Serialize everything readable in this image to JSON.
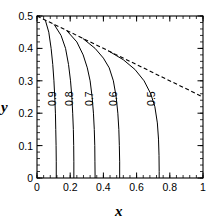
{
  "chart_data": {
    "type": "line",
    "title": "",
    "xlabel": "x",
    "ylabel": "y",
    "xlim": [
      0,
      1
    ],
    "ylim": [
      0,
      0.5
    ],
    "grid": false,
    "legend": null,
    "xticks": [
      "0",
      "0.2",
      "0.4",
      "0.6",
      "0.8",
      "1"
    ],
    "xtick_values": [
      0,
      0.2,
      0.4,
      0.6,
      0.8,
      1
    ],
    "yticks": [
      "0",
      "0.1",
      "0.2",
      "0.3",
      "0.4",
      "0.5"
    ],
    "ytick_values": [
      0,
      0.1,
      0.2,
      0.3,
      0.4,
      0.5
    ],
    "minor_ticks_per_interval": 4,
    "tick_direction": "in",
    "series": [
      {
        "name": "0.9",
        "label": "0.9",
        "style": "solid",
        "color": "#000000",
        "label_x": 0.115,
        "label_y": 0.245,
        "points": [
          [
            0.05,
            0.4875
          ],
          [
            0.071,
            0.45
          ],
          [
            0.085,
            0.4
          ],
          [
            0.095,
            0.35
          ],
          [
            0.102,
            0.3
          ],
          [
            0.107,
            0.25
          ],
          [
            0.111,
            0.2
          ],
          [
            0.113,
            0.15
          ],
          [
            0.115,
            0.1
          ],
          [
            0.116,
            0.05
          ],
          [
            0.116,
            0.0
          ]
        ]
      },
      {
        "name": "0.8",
        "label": "0.8",
        "style": "solid",
        "color": "#000000",
        "label_x": 0.218,
        "label_y": 0.245,
        "points": [
          [
            0.103,
            0.474
          ],
          [
            0.145,
            0.44
          ],
          [
            0.172,
            0.4
          ],
          [
            0.19,
            0.35
          ],
          [
            0.202,
            0.3
          ],
          [
            0.21,
            0.25
          ],
          [
            0.215,
            0.2
          ],
          [
            0.219,
            0.15
          ],
          [
            0.221,
            0.1
          ],
          [
            0.222,
            0.05
          ],
          [
            0.222,
            0.0
          ]
        ]
      },
      {
        "name": "0.7",
        "label": "0.7",
        "style": "solid",
        "color": "#000000",
        "label_x": 0.34,
        "label_y": 0.245,
        "points": [
          [
            0.178,
            0.4555
          ],
          [
            0.24,
            0.42
          ],
          [
            0.278,
            0.38
          ],
          [
            0.303,
            0.34
          ],
          [
            0.32,
            0.3
          ],
          [
            0.332,
            0.25
          ],
          [
            0.34,
            0.2
          ],
          [
            0.345,
            0.15
          ],
          [
            0.348,
            0.1
          ],
          [
            0.349,
            0.05
          ],
          [
            0.35,
            0.0
          ]
        ]
      },
      {
        "name": "0.6",
        "label": "0.6",
        "style": "solid",
        "color": "#000000",
        "label_x": 0.482,
        "label_y": 0.245,
        "points": [
          [
            0.275,
            0.4312
          ],
          [
            0.35,
            0.4
          ],
          [
            0.4,
            0.37
          ],
          [
            0.435,
            0.34
          ],
          [
            0.46,
            0.3
          ],
          [
            0.477,
            0.25
          ],
          [
            0.487,
            0.2
          ],
          [
            0.493,
            0.15
          ],
          [
            0.496,
            0.1
          ],
          [
            0.498,
            0.05
          ],
          [
            0.498,
            0.0
          ]
        ]
      },
      {
        "name": "0.5",
        "label": "0.5",
        "style": "solid",
        "color": "#000000",
        "label_x": 0.712,
        "label_y": 0.245,
        "points": [
          [
            0.43,
            0.3925
          ],
          [
            0.52,
            0.365
          ],
          [
            0.59,
            0.335
          ],
          [
            0.645,
            0.3
          ],
          [
            0.685,
            0.26
          ],
          [
            0.71,
            0.22
          ],
          [
            0.725,
            0.17
          ],
          [
            0.732,
            0.12
          ],
          [
            0.735,
            0.07
          ],
          [
            0.736,
            0.02
          ],
          [
            0.736,
            0.0
          ]
        ]
      },
      {
        "name": "envelope",
        "label": "",
        "style": "dashed",
        "color": "#000000",
        "points": [
          [
            0.0,
            0.5
          ],
          [
            1.0,
            0.25
          ]
        ]
      }
    ]
  }
}
